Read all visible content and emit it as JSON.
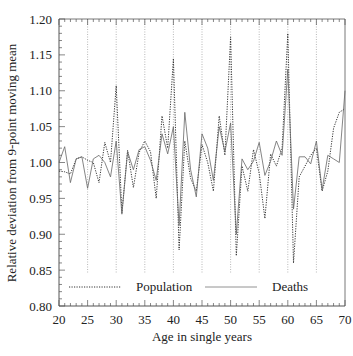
{
  "chart_data": {
    "type": "line",
    "title": "",
    "xlabel": "Age in single years",
    "ylabel": "Relative deviation from 9-point moving mean",
    "xlim": [
      20,
      70
    ],
    "ylim": [
      0.8,
      1.2
    ],
    "x_ticks": [
      20,
      25,
      30,
      35,
      40,
      45,
      50,
      55,
      60,
      65,
      70
    ],
    "x_tick_labels": [
      "20",
      "25",
      "30",
      "35",
      "40",
      "45",
      "50",
      "55",
      "60",
      "65",
      "70"
    ],
    "y_ticks": [
      0.8,
      0.85,
      0.9,
      0.95,
      1.0,
      1.05,
      1.1,
      1.15,
      1.2
    ],
    "y_tick_labels": [
      "0.80",
      "0.85",
      "0.90",
      "0.95",
      "1.00",
      "1.05",
      "1.10",
      "1.15",
      "1.20"
    ],
    "grid": "vertical dotted lines at multiples of 5",
    "legend_position": "bottom inside",
    "x": [
      20,
      21,
      22,
      23,
      24,
      25,
      26,
      27,
      28,
      29,
      30,
      31,
      32,
      33,
      34,
      35,
      36,
      37,
      38,
      39,
      40,
      41,
      42,
      43,
      44,
      45,
      46,
      47,
      48,
      49,
      50,
      51,
      52,
      53,
      54,
      55,
      56,
      57,
      58,
      59,
      60,
      61,
      62,
      63,
      64,
      65,
      66,
      67,
      68,
      69,
      70
    ],
    "series": [
      {
        "name": "Population",
        "style": "dotted",
        "values": [
          0.988,
          0.987,
          0.984,
          1.005,
          1.008,
          1.003,
          1.0,
          0.972,
          1.028,
          1.0,
          1.107,
          0.93,
          1.017,
          0.965,
          1.014,
          1.03,
          1.015,
          0.95,
          1.065,
          1.02,
          1.145,
          0.878,
          1.03,
          0.978,
          0.96,
          1.025,
          1.0,
          0.96,
          1.065,
          1.01,
          1.175,
          0.87,
          0.995,
          0.96,
          1.018,
          0.985,
          0.922,
          1.012,
          0.995,
          1.02,
          1.18,
          0.86,
          0.98,
          0.995,
          1.01,
          1.02,
          0.96,
          0.988,
          1.048,
          1.07,
          1.075
        ]
      },
      {
        "name": "Deaths",
        "style": "solid",
        "values": [
          1.0,
          1.022,
          0.972,
          1.005,
          1.008,
          0.964,
          1.005,
          1.01,
          1.0,
          0.98,
          1.03,
          0.928,
          1.015,
          0.99,
          1.018,
          1.022,
          1.003,
          0.975,
          1.04,
          1.012,
          1.05,
          0.912,
          1.07,
          0.99,
          0.952,
          1.04,
          1.02,
          0.975,
          1.05,
          1.015,
          1.055,
          0.9,
          1.005,
          0.99,
          1.002,
          1.028,
          0.982,
          1.002,
          1.03,
          1.01,
          1.13,
          0.935,
          1.008,
          1.008,
          0.998,
          1.03,
          0.962,
          1.01,
          1.005,
          1.0,
          1.1
        ]
      }
    ]
  },
  "legend": {
    "population_label": "Population",
    "deaths_label": "Deaths"
  },
  "colors": {
    "population": "#333333",
    "deaths": "#666666",
    "grid": "#999999",
    "axis": "#555555"
  }
}
